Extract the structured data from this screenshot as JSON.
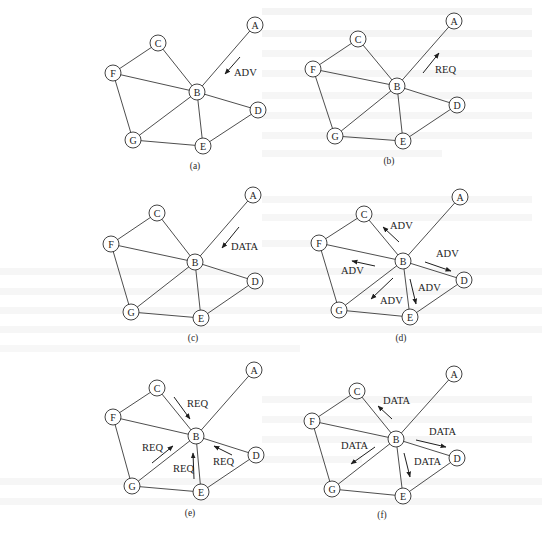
{
  "figure": {
    "node_radius": 8,
    "edges": [
      [
        "A",
        "B"
      ],
      [
        "C",
        "F"
      ],
      [
        "C",
        "B"
      ],
      [
        "F",
        "B"
      ],
      [
        "F",
        "G"
      ],
      [
        "B",
        "G"
      ],
      [
        "B",
        "E"
      ],
      [
        "B",
        "D"
      ],
      [
        "G",
        "E"
      ],
      [
        "E",
        "D"
      ]
    ],
    "panels": [
      {
        "id": "a",
        "caption": "(a)",
        "caption_pos": [
          195,
          169
        ],
        "nodes": {
          "A": [
            255,
            25
          ],
          "C": [
            158,
            43
          ],
          "F": [
            113,
            73
          ],
          "B": [
            197,
            92
          ],
          "D": [
            258,
            110
          ],
          "G": [
            133,
            140
          ],
          "E": [
            203,
            146
          ]
        },
        "messages": [
          {
            "label": "ADV",
            "from": [
              240,
              57
            ],
            "to": [
              225,
              74
            ],
            "label_pos": [
              234,
              76
            ],
            "direction": "A to B"
          }
        ]
      },
      {
        "id": "b",
        "caption": "(b)",
        "caption_pos": [
          389,
          164
        ],
        "nodes": {
          "A": [
            454,
            21
          ],
          "C": [
            358,
            39
          ],
          "F": [
            313,
            69
          ],
          "B": [
            397,
            86
          ],
          "D": [
            457,
            105
          ],
          "G": [
            335,
            136
          ],
          "E": [
            403,
            141
          ]
        },
        "messages": [
          {
            "label": "REQ",
            "from": [
              423,
              73
            ],
            "to": [
              439,
              53
            ],
            "label_pos": [
              435,
              73
            ],
            "direction": "B to A"
          }
        ]
      },
      {
        "id": "c",
        "caption": "(c)",
        "caption_pos": [
          193,
          341
        ],
        "nodes": {
          "A": [
            253,
            195
          ],
          "C": [
            157,
            213
          ],
          "F": [
            111,
            244
          ],
          "B": [
            195,
            262
          ],
          "D": [
            255,
            281
          ],
          "G": [
            131,
            312
          ],
          "E": [
            201,
            318
          ]
        },
        "messages": [
          {
            "label": "DATA",
            "from": [
              239,
              227
            ],
            "to": [
              222,
              248
            ],
            "label_pos": [
              231,
              250
            ],
            "direction": "A to B"
          }
        ]
      },
      {
        "id": "d",
        "caption": "(d)",
        "caption_pos": [
          401,
          341
        ],
        "nodes": {
          "A": [
            460,
            197
          ],
          "C": [
            364,
            214
          ],
          "F": [
            319,
            243
          ],
          "B": [
            403,
            261
          ],
          "D": [
            464,
            280
          ],
          "G": [
            339,
            310
          ],
          "E": [
            410,
            317
          ]
        },
        "messages": [
          {
            "label": "ADV",
            "from": [
              399,
              242
            ],
            "to": [
              383,
              227
            ],
            "label_pos": [
              390,
              229
            ],
            "direction": "B to C"
          },
          {
            "label": "ADV",
            "from": [
              375,
              266
            ],
            "to": [
              352,
              261
            ],
            "label_pos": [
              341,
              274
            ],
            "direction": "B to F"
          },
          {
            "label": "ADV",
            "from": [
              425,
              262
            ],
            "to": [
              451,
              271
            ],
            "label_pos": [
              436,
              257
            ],
            "direction": "B to D"
          },
          {
            "label": "ADV",
            "from": [
              393,
              278
            ],
            "to": [
              371,
              299
            ],
            "label_pos": [
              380,
              304
            ],
            "direction": "B to G"
          },
          {
            "label": "ADV",
            "from": [
              410,
              279
            ],
            "to": [
              416,
              304
            ],
            "label_pos": [
              418,
              291
            ],
            "direction": "B to E"
          }
        ]
      },
      {
        "id": "e",
        "caption": "(e)",
        "caption_pos": [
          190,
          516
        ],
        "nodes": {
          "A": [
            254,
            370
          ],
          "C": [
            157,
            388
          ],
          "F": [
            113,
            417
          ],
          "B": [
            196,
            436
          ],
          "D": [
            256,
            455
          ],
          "G": [
            132,
            486
          ],
          "E": [
            201,
            492
          ]
        },
        "messages": [
          {
            "label": "REQ",
            "from": [
              174,
              397
            ],
            "to": [
              190,
              419
            ],
            "label_pos": [
              187,
              407
            ],
            "direction": "C to B"
          },
          {
            "label": "REQ",
            "from": [
              152,
              463
            ],
            "to": [
              173,
              446
            ],
            "label_pos": [
              142,
              451
            ],
            "direction": "G to B"
          },
          {
            "label": "REQ",
            "from": [
              194,
              479
            ],
            "to": [
              193,
              453
            ],
            "label_pos": [
              173,
              472
            ],
            "direction": "E to B"
          },
          {
            "label": "REQ",
            "from": [
              232,
              455
            ],
            "to": [
              214,
              446
            ],
            "label_pos": [
              213,
              465
            ],
            "direction": "D to B"
          }
        ]
      },
      {
        "id": "f",
        "caption": "(f)",
        "caption_pos": [
          382,
          518
        ],
        "nodes": {
          "A": [
            454,
            374
          ],
          "C": [
            357,
            391
          ],
          "F": [
            312,
            421
          ],
          "B": [
            396,
            439
          ],
          "D": [
            457,
            458
          ],
          "G": [
            332,
            489
          ],
          "E": [
            403,
            496
          ]
        },
        "messages": [
          {
            "label": "DATA",
            "from": [
              392,
              419
            ],
            "to": [
              378,
              406
            ],
            "label_pos": [
              383,
              404
            ],
            "direction": "B to C"
          },
          {
            "label": "DATA",
            "from": [
              416,
              440
            ],
            "to": [
              446,
              447
            ],
            "label_pos": [
              429,
              435
            ],
            "direction": "B to D"
          },
          {
            "label": "DATA",
            "from": [
              375,
              447
            ],
            "to": [
              351,
              464
            ],
            "label_pos": [
              341,
              449
            ],
            "direction": "B to G"
          },
          {
            "label": "DATA",
            "from": [
              404,
              453
            ],
            "to": [
              410,
              477
            ],
            "label_pos": [
              414,
              465
            ],
            "direction": "B to E"
          }
        ]
      }
    ]
  },
  "colors": {
    "ink": "#1e1e1e",
    "edge": "#3a3a3a",
    "background": "#ffffff",
    "bleed_through": "#e6e6e6"
  }
}
